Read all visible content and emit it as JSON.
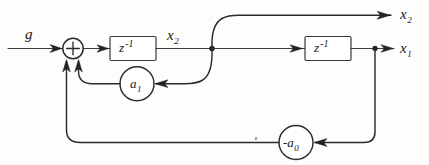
{
  "diagram": {
    "type": "signal-flow-block-diagram",
    "style": "hand-drawn",
    "colors": {
      "background": "#fdfdfc",
      "ink": "#2b2b2b",
      "ink_light": "#3a3a38",
      "arrow": "#232323"
    },
    "input": {
      "label": "g",
      "name": "input-signal-g"
    },
    "summing_junction": {
      "sign": "+",
      "name": "summing-junction"
    },
    "delay_blocks": [
      {
        "id": "delay-1",
        "base": "z",
        "exponent": "-1",
        "output_label": "x",
        "output_subscript": "2"
      },
      {
        "id": "delay-2",
        "base": "z",
        "exponent": "-1",
        "output_label": "x",
        "output_subscript": "1"
      }
    ],
    "gains": [
      {
        "id": "gain-a1",
        "label": "a",
        "subscript": "1",
        "prefix": "",
        "full": "a1"
      },
      {
        "id": "gain-a0",
        "label": "a",
        "subscript": "0",
        "prefix": "-",
        "full": "-a0"
      }
    ],
    "outputs": [
      {
        "id": "output-x2",
        "label": "x",
        "subscript": "2"
      },
      {
        "id": "output-x1",
        "label": "x",
        "subscript": "1"
      }
    ],
    "internal_labels": [
      {
        "id": "node-x2",
        "label": "x",
        "subscript": "2"
      }
    ]
  }
}
